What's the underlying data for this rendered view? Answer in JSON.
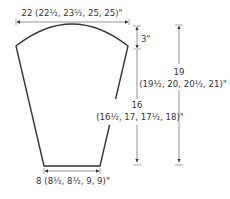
{
  "diagram": {
    "type": "knitting-schematic",
    "colors": {
      "outline": "#333333",
      "dimension": "#555555",
      "text": "#333333",
      "background": "#ffffff"
    },
    "labels": {
      "top_width": "22 (22½, 23½, 25, 25)\"",
      "cap_depth": "3\"",
      "side_length_value": "16",
      "side_length_sizes": "(16½, 17, 17½, 18)\"",
      "total_length_value": "19",
      "total_length_sizes": "(19½, 20, 20½, 21)\"",
      "bottom_width": "8 (8½, 8½, 9, 9)\""
    }
  }
}
